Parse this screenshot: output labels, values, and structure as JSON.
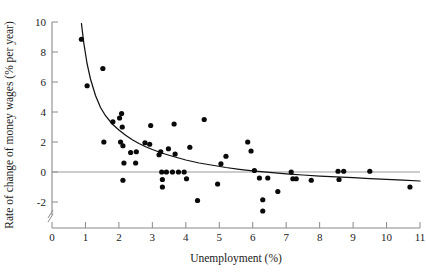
{
  "chart_data": {
    "type": "scatter",
    "title": "",
    "xlabel": "Unemployment (%)",
    "ylabel": "Rate of change of money wages (% per year)",
    "xlim": [
      0,
      11
    ],
    "ylim": [
      -3,
      10
    ],
    "grid": false,
    "legend": null,
    "x_ticks": [
      0,
      1,
      2,
      3,
      4,
      5,
      6,
      7,
      8,
      9,
      10,
      11
    ],
    "x_tick_labels": [
      "0",
      "1",
      "2",
      "3",
      "4",
      "5",
      "6",
      "7",
      "8",
      "9",
      "10",
      "11"
    ],
    "y_ticks": [
      -2,
      0,
      2,
      4,
      6,
      8,
      10
    ],
    "y_tick_labels": [
      "-2",
      "0",
      "2",
      "4",
      "6",
      "8",
      "10"
    ],
    "y_axis_break": true,
    "zero_reference_line": 0,
    "points": [
      [
        0.88,
        8.85
      ],
      [
        1.05,
        5.75
      ],
      [
        1.52,
        6.9
      ],
      [
        1.55,
        2.0
      ],
      [
        1.82,
        3.35
      ],
      [
        2.02,
        3.6
      ],
      [
        2.08,
        3.9
      ],
      [
        2.1,
        3.0
      ],
      [
        2.05,
        2.0
      ],
      [
        2.12,
        1.75
      ],
      [
        2.15,
        0.6
      ],
      [
        2.12,
        -0.55
      ],
      [
        2.35,
        1.3
      ],
      [
        2.52,
        1.35
      ],
      [
        2.5,
        0.6
      ],
      [
        2.78,
        1.95
      ],
      [
        2.95,
        3.1
      ],
      [
        2.92,
        1.85
      ],
      [
        3.2,
        1.15
      ],
      [
        3.25,
        1.35
      ],
      [
        3.28,
        0.0
      ],
      [
        3.3,
        -0.5
      ],
      [
        3.3,
        -1.0
      ],
      [
        3.42,
        0.0
      ],
      [
        3.48,
        1.55
      ],
      [
        3.6,
        0.0
      ],
      [
        3.65,
        3.2
      ],
      [
        3.68,
        1.2
      ],
      [
        3.78,
        0.0
      ],
      [
        3.95,
        0.0
      ],
      [
        4.02,
        -0.45
      ],
      [
        4.12,
        1.65
      ],
      [
        4.35,
        -1.9
      ],
      [
        4.55,
        3.5
      ],
      [
        4.95,
        -0.8
      ],
      [
        5.05,
        0.55
      ],
      [
        5.2,
        1.05
      ],
      [
        5.85,
        2.0
      ],
      [
        5.95,
        1.4
      ],
      [
        6.05,
        0.1
      ],
      [
        6.2,
        -0.4
      ],
      [
        6.3,
        -1.85
      ],
      [
        6.3,
        -2.6
      ],
      [
        6.45,
        -0.4
      ],
      [
        6.75,
        -1.3
      ],
      [
        7.15,
        0.0
      ],
      [
        7.2,
        -0.45
      ],
      [
        7.3,
        -0.45
      ],
      [
        7.75,
        -0.55
      ],
      [
        8.55,
        0.05
      ],
      [
        8.58,
        -0.5
      ],
      [
        8.72,
        0.05
      ],
      [
        9.5,
        0.05
      ],
      [
        10.7,
        -1.0
      ]
    ],
    "fit_curve": {
      "description": "Phillips curve fit",
      "x": [
        0.88,
        0.95,
        1.05,
        1.15,
        1.3,
        1.45,
        1.6,
        1.8,
        2.0,
        2.2,
        2.4,
        2.6,
        2.8,
        3.0,
        3.3,
        3.6,
        4.0,
        4.4,
        4.8,
        5.2,
        5.6,
        6.0,
        6.5,
        7.0,
        7.5,
        8.0,
        8.5,
        9.0,
        9.5,
        10.0,
        10.5,
        11.0
      ],
      "y": [
        9.9,
        8.6,
        7.2,
        6.2,
        5.1,
        4.3,
        3.75,
        3.2,
        2.8,
        2.45,
        2.15,
        1.9,
        1.68,
        1.5,
        1.25,
        1.05,
        0.8,
        0.6,
        0.45,
        0.3,
        0.18,
        0.08,
        -0.03,
        -0.12,
        -0.2,
        -0.27,
        -0.33,
        -0.38,
        -0.44,
        -0.49,
        -0.54,
        -0.6
      ]
    }
  },
  "axes": {
    "x_axis_title": "Unemployment (%)",
    "y_axis_title": "Rate of change of money wages (% per year)"
  }
}
